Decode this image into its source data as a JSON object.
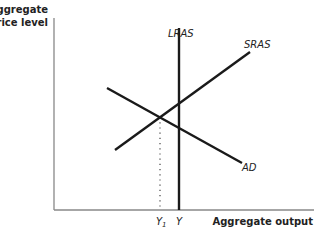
{
  "diagram": {
    "type": "AD-AS model",
    "y_axis_title_line1": "Aggregate",
    "y_axis_title_line2": "price level",
    "x_axis_title": "Aggregate output",
    "curves": {
      "lras": {
        "label": "LRAS"
      },
      "sras": {
        "label": "SRAS"
      },
      "ad": {
        "label": "AD"
      }
    },
    "x_ticks": {
      "y1_main": "Y",
      "y1_sub": "1",
      "y": "Y"
    },
    "colors": {
      "axis": "#888888",
      "curve": "#1a1a1a",
      "dotted": "#444444"
    }
  }
}
